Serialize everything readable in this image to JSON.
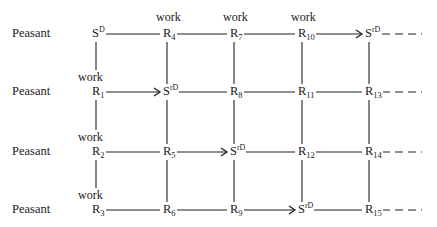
{
  "diagram": {
    "row_labels": [
      "Peasant",
      "Peasant",
      "Peasant",
      "Peasant"
    ],
    "edge_label": "work",
    "columns_x": [
      97,
      168,
      235,
      303,
      370
    ],
    "rows_y": [
      34,
      92,
      152,
      210
    ],
    "nodes": [
      [
        {
          "base": "S",
          "sup": "D",
          "sub": ""
        },
        {
          "base": "R",
          "sup": "",
          "sub": "4"
        },
        {
          "base": "R",
          "sup": "",
          "sub": "7"
        },
        {
          "base": "R",
          "sup": "",
          "sub": "10"
        },
        {
          "base": "S",
          "sup": "rD",
          "sub": ""
        }
      ],
      [
        {
          "base": "R",
          "sup": "",
          "sub": "1"
        },
        {
          "base": "S",
          "sup": "rD",
          "sub": ""
        },
        {
          "base": "R",
          "sup": "",
          "sub": "8"
        },
        {
          "base": "R",
          "sup": "",
          "sub": "11"
        },
        {
          "base": "R",
          "sup": "",
          "sub": "13"
        }
      ],
      [
        {
          "base": "R",
          "sup": "",
          "sub": "2"
        },
        {
          "base": "R",
          "sup": "",
          "sub": "5"
        },
        {
          "base": "S",
          "sup": "rD",
          "sub": ""
        },
        {
          "base": "R",
          "sup": "",
          "sub": "12"
        },
        {
          "base": "R",
          "sup": "",
          "sub": "14"
        }
      ],
      [
        {
          "base": "R",
          "sup": "",
          "sub": "3"
        },
        {
          "base": "R",
          "sup": "",
          "sub": "6"
        },
        {
          "base": "R",
          "sup": "",
          "sub": "9"
        },
        {
          "base": "S",
          "sup": "rD",
          "sub": ""
        },
        {
          "base": "R",
          "sup": "",
          "sub": "15"
        }
      ]
    ],
    "horizontal_arrows": [
      {
        "row": 0,
        "from_col": 3,
        "to_col": 4
      },
      {
        "row": 1,
        "from_col": 0,
        "to_col": 1
      },
      {
        "row": 2,
        "from_col": 1,
        "to_col": 2
      },
      {
        "row": 3,
        "from_col": 2,
        "to_col": 3
      }
    ],
    "work_labels_top": [
      {
        "col": 1
      },
      {
        "col": 2
      },
      {
        "col": 3
      }
    ],
    "work_labels_left": [
      {
        "row": 1
      },
      {
        "row": 2
      },
      {
        "row": 3
      }
    ],
    "trailing": "dashed",
    "line_color": "#222222"
  }
}
